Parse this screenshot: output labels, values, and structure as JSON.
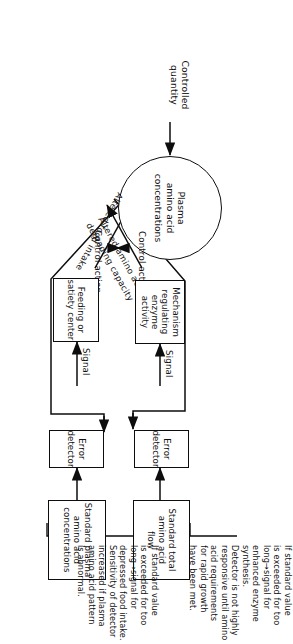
{
  "figure": {
    "type": "control-system block diagram",
    "orientation": "rotated 90 degrees clockwise on the page",
    "controlled_quantity_label": "Controlled\nquantity",
    "plant": {
      "shape": "circle",
      "label": "Plasma\namino acid\nconcentrations"
    },
    "loops": [
      {
        "id": "feeding-loop",
        "control_action_label": "Control action",
        "effector_arrow_label": "Altered food intake",
        "controller_box": "Feeding or\nsatiety center",
        "signal_label": "Signal",
        "error_detector_box": "Error\ndetector",
        "standard_box": "Standard plasma\namino acid\nconcentrations",
        "note": "If standard value\nis exceeded for too\nlong→signal for\ndepressed food intake.\n  Sensitivity of detector\nincreased if plasma\namino acid pattern\nis abnormal."
      },
      {
        "id": "enzyme-loop",
        "control_action_label": "Control action",
        "effector_arrow_label": "Altered amino acid\ndegrading capacity",
        "effector_arrow_line1": "Altered amino acid",
        "effector_arrow_line2": "degrading capacity",
        "controller_box": "Mechanism\nregulating\nenzyme\nactivity",
        "signal_label": "Signal",
        "error_detector_box": "Error\ndetector",
        "standard_box": "Standard total\namino acid\nflow",
        "note": "If standard value\nis exceeded for too\nlong→signal for\nenhanced enzyme\nsynthesis.\n  Detector is not highly\nresponsive until amino\nacid requirements\nfor rapid growth\nhave been met."
      }
    ],
    "colors": {
      "ink": "#0d0d0d",
      "paper": "#ffffff"
    }
  }
}
